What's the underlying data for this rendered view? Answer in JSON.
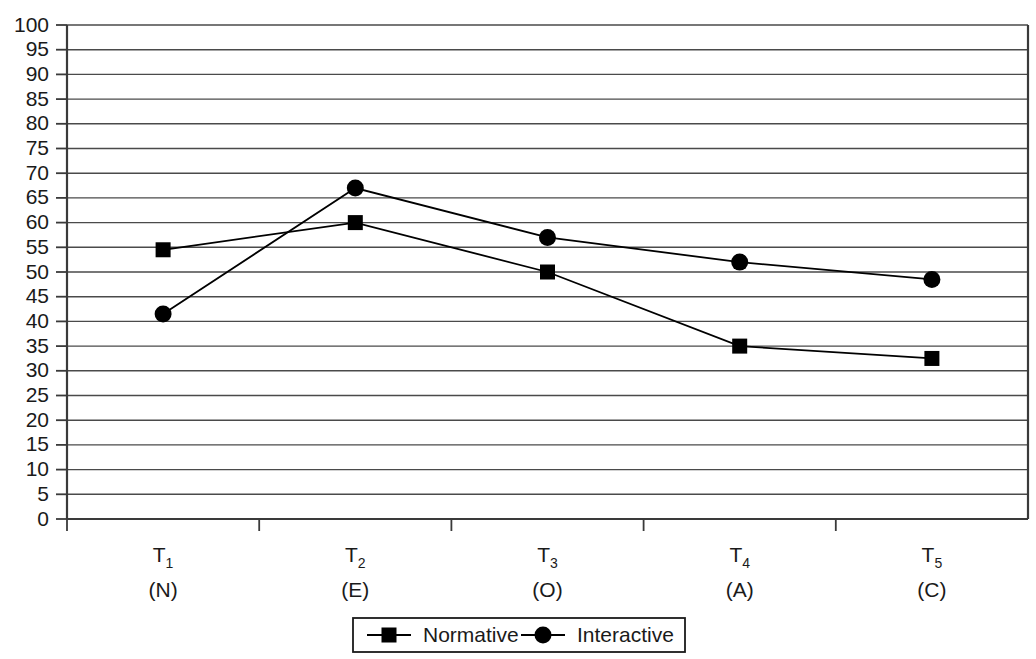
{
  "chart_data": {
    "type": "line",
    "title": "",
    "subtitle": "",
    "xlabel": "",
    "ylabel": "",
    "categories": [
      "T1",
      "T2",
      "T3",
      "T4",
      "T5"
    ],
    "category_subscripts": [
      "1",
      "2",
      "3",
      "4",
      "5"
    ],
    "category_prefix": "T",
    "category_sublabels": [
      "(N)",
      "(E)",
      "(O)",
      "(A)",
      "(C)"
    ],
    "ylim": [
      0,
      100
    ],
    "ytick_step": 5,
    "yticks": [
      0,
      5,
      10,
      15,
      20,
      25,
      30,
      35,
      40,
      45,
      50,
      55,
      60,
      65,
      70,
      75,
      80,
      85,
      90,
      95,
      100
    ],
    "ytick_labels": [
      "0",
      "5",
      "10",
      "15",
      "20",
      "25",
      "30",
      "35",
      "40",
      "45",
      "50",
      "55",
      "60",
      "65",
      "70",
      "75",
      "80",
      "85",
      "90",
      "95",
      "100"
    ],
    "grid": true,
    "grid_axis": "y",
    "legend_position": "bottom",
    "series": [
      {
        "name": "Normative",
        "marker": "square",
        "color": "#000000",
        "values": [
          54.5,
          60,
          50,
          35,
          32.5
        ]
      },
      {
        "name": "Interactive",
        "marker": "circle",
        "color": "#000000",
        "values": [
          41.5,
          67,
          57,
          52,
          48.5
        ]
      }
    ]
  },
  "legend": {
    "items": [
      {
        "label": "Normative",
        "marker": "square"
      },
      {
        "label": "Interactive",
        "marker": "circle"
      }
    ]
  },
  "colors": {
    "axis": "#3a3a3a",
    "grid": "#4a4a4a",
    "series": "#000000",
    "background": "#ffffff",
    "text": "#1a1a1a"
  }
}
